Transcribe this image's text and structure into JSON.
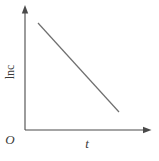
{
  "figure": {
    "axis_color": "#4a4a4a",
    "line_color": "#6f6f6f",
    "background_color": "#ffffff"
  },
  "chart_data": {
    "type": "line",
    "title": "",
    "xlabel": "t",
    "ylabel": "lnc",
    "origin_label": "O",
    "axes": {
      "x_range_px": [
        25,
        147
      ],
      "y_range_px": [
        130,
        9
      ],
      "ticks": false,
      "grid": false,
      "arrows": true
    },
    "series": [
      {
        "name": "ln-c-vs-t-line",
        "trend": "linear-decreasing",
        "points_px": [
          [
            38,
            23
          ],
          [
            119,
            112
          ]
        ]
      }
    ]
  }
}
